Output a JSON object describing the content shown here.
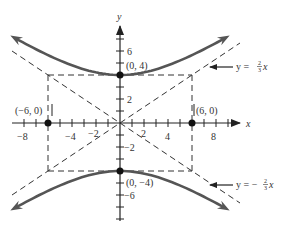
{
  "chart_data": {
    "type": "line",
    "title": "",
    "xlabel": "x",
    "ylabel": "y",
    "xlim": [
      -9,
      10
    ],
    "ylim": [
      -8,
      8
    ],
    "x_ticks": [
      -8,
      -7,
      -6,
      -5,
      -4,
      -3,
      -2,
      -1,
      1,
      2,
      3,
      4,
      5,
      6,
      7,
      8,
      9
    ],
    "x_tick_labels": [
      "-8",
      "-4",
      "-2",
      "2",
      "4",
      "8"
    ],
    "x_tick_label_values": [
      -8,
      -4,
      -2,
      2,
      4,
      8
    ],
    "y_ticks": [
      -8,
      -7,
      -6,
      -5,
      -4,
      -3,
      -2,
      -1,
      1,
      2,
      3,
      4,
      5,
      6,
      7
    ],
    "y_tick_labels": [
      "6",
      "2",
      "-2",
      "-6"
    ],
    "y_tick_label_values": [
      6,
      2,
      -2,
      -6
    ],
    "grid": false,
    "series": [
      {
        "name": "hyperbola upper branch",
        "style": "solid-thick",
        "equation": "y = 4*sqrt(1 + x^2/36)",
        "x_range": [
          -8.7,
          8.7
        ]
      },
      {
        "name": "hyperbola lower branch",
        "style": "solid-thick",
        "equation": "y = -4*sqrt(1 + x^2/36)",
        "x_range": [
          -8.7,
          8.7
        ]
      },
      {
        "name": "asymptote positive",
        "style": "dashed",
        "equation": "y = (2/3)x",
        "label": "y = ⅔x",
        "x_range": [
          -9,
          10
        ]
      },
      {
        "name": "asymptote negative",
        "style": "dashed",
        "equation": "y = -(2/3)x",
        "label": "y = -⅔x",
        "x_range": [
          -9,
          10
        ]
      },
      {
        "name": "central rectangle",
        "style": "dashed",
        "corners": [
          [
            -6,
            4
          ],
          [
            6,
            4
          ],
          [
            6,
            -4
          ],
          [
            -6,
            -4
          ]
        ]
      }
    ],
    "points": [
      {
        "x": 0,
        "y": 4,
        "label": "(0, 4)"
      },
      {
        "x": 0,
        "y": -4,
        "label": "(0, −4)"
      },
      {
        "x": -6,
        "y": 0,
        "label": "(−6, 0)"
      },
      {
        "x": 6,
        "y": 0,
        "label": "(6, 0)"
      }
    ],
    "annotations": [
      {
        "text": "y = ⅔x",
        "points_to": "asymptote positive"
      },
      {
        "text": "y = −⅔x",
        "points_to": "asymptote negative"
      }
    ]
  },
  "labels": {
    "x_axis": "x",
    "y_axis": "y",
    "pt_top": "(0, 4)",
    "pt_bottom": "(0, −4)",
    "pt_left": "(−6, 0)",
    "pt_right": "(6, 0)",
    "eq_pos_prefix": "y = ",
    "eq_neg_prefix": "y = −",
    "eq_num": "2",
    "eq_den": "3",
    "eq_var": "x",
    "tick_m8": "−8",
    "tick_m4": "−4",
    "tick_m2": "−2",
    "tick_2": "2",
    "tick_4": "4",
    "tick_8": "8",
    "tick_y6": "6",
    "tick_y2": "2",
    "tick_ym2": "−2",
    "tick_ym6": "−6"
  },
  "colors": {
    "curve": "#555555",
    "axis": "#333333",
    "dashed": "#333333",
    "background": "#ffffff"
  }
}
